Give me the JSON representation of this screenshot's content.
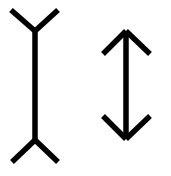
{
  "diagram": {
    "type": "muller-lyer-illusion",
    "background": "#ffffff",
    "stroke_color": "#000000",
    "figures": [
      {
        "name": "fins-out",
        "shaft": {
          "x": 35,
          "y1": 31,
          "y2": 140
        },
        "fins": [
          {
            "from": [
              35,
              31
            ],
            "to": [
              11,
              10
            ]
          },
          {
            "from": [
              35,
              31
            ],
            "to": [
              58,
              10
            ]
          },
          {
            "from": [
              35,
              140
            ],
            "to": [
              12,
              162
            ]
          },
          {
            "from": [
              35,
              140
            ],
            "to": [
              58,
              162
            ]
          }
        ]
      },
      {
        "name": "fins-in",
        "shaft": {
          "x": 126,
          "y1": 31,
          "y2": 139
        },
        "fins": [
          {
            "from": [
              126,
              31
            ],
            "to": [
              103,
              54
            ]
          },
          {
            "from": [
              126,
              31
            ],
            "to": [
              150,
              54
            ]
          },
          {
            "from": [
              126,
              139
            ],
            "to": [
              103,
              116
            ]
          },
          {
            "from": [
              126,
              139
            ],
            "to": [
              150,
              116
            ]
          }
        ]
      }
    ]
  }
}
